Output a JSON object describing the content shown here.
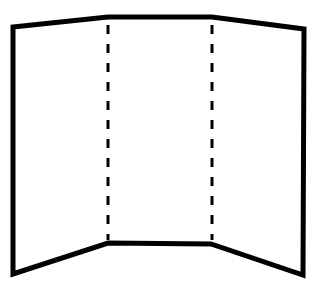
{
  "diagram": {
    "colors": {
      "background": "#ffffff",
      "stroke": "#000000"
    },
    "outline": {
      "points": [
        [
          13,
          27
        ],
        [
          108,
          17
        ],
        [
          212,
          17
        ],
        [
          304,
          29
        ],
        [
          303,
          275
        ],
        [
          211,
          244
        ],
        [
          108,
          243
        ],
        [
          13,
          274
        ]
      ],
      "stroke_width": 5
    },
    "inner_bottom_edge": {
      "from": [
        108,
        243
      ],
      "to": [
        211,
        244
      ]
    },
    "fold_lines": [
      {
        "name": "left-fold",
        "x": 108,
        "y1": 25,
        "y2": 240,
        "dash": "9 10",
        "stroke_width": 3
      },
      {
        "name": "right-fold",
        "x": 212,
        "y1": 25,
        "y2": 240,
        "dash": "9 10",
        "stroke_width": 3
      }
    ],
    "panels": [
      "left-panel",
      "center-panel",
      "right-panel"
    ]
  }
}
